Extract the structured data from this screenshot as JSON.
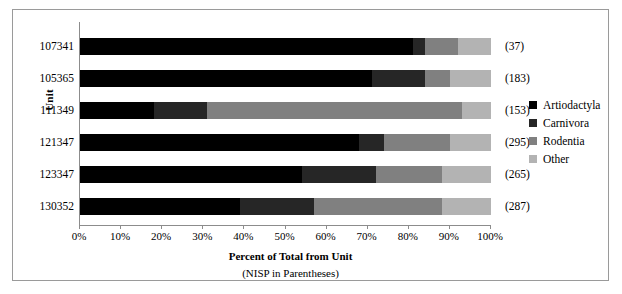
{
  "chart_data": {
    "type": "bar",
    "orientation": "horizontal",
    "stacked": true,
    "normalized": "100%",
    "title": "",
    "xlabel": "Percent of Total from Unit",
    "xlabel_sub": "(NISP in Parentheses)",
    "ylabel": "Unit",
    "categories": [
      "107341",
      "105365",
      "111349",
      "121347",
      "123347",
      "130352"
    ],
    "annotations": [
      "(37)",
      "(183)",
      "(153)",
      "(295)",
      "(265)",
      "(287)"
    ],
    "annotation_meaning": "NISP in Parentheses",
    "xlim": [
      0,
      100
    ],
    "xticks": [
      0,
      10,
      20,
      30,
      40,
      50,
      60,
      70,
      80,
      90,
      100
    ],
    "xtick_labels": [
      "0%",
      "10%",
      "20%",
      "30%",
      "40%",
      "50%",
      "60%",
      "70%",
      "80%",
      "90%",
      "100%"
    ],
    "grid": false,
    "legend_position": "right",
    "series": [
      {
        "name": "Artiodactyla",
        "color": "#000000",
        "values": [
          81,
          71,
          18,
          68,
          54,
          39
        ]
      },
      {
        "name": "Carnivora",
        "color": "#262626",
        "values": [
          3,
          13,
          13,
          6,
          18,
          18
        ]
      },
      {
        "name": "Rodentia",
        "color": "#808080",
        "values": [
          8,
          6,
          62,
          16,
          16,
          31
        ]
      },
      {
        "name": "Other",
        "color": "#b3b3b3",
        "values": [
          8,
          10,
          7,
          10,
          12,
          12
        ]
      }
    ]
  },
  "colors": {
    "frame_border": "#9a9a9a",
    "axis": "#8c8c8c",
    "background": "#ffffff",
    "text": "#000000"
  }
}
